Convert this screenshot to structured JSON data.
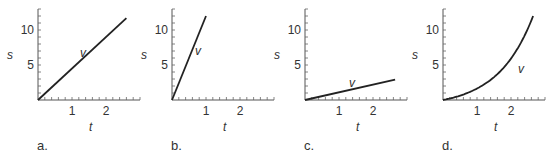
{
  "figure": {
    "panels": [
      {
        "id": "a",
        "label": "a.",
        "curve_label": "v",
        "xlabel": "t",
        "ylabel": "s",
        "x_tick_labels": [
          "1",
          "2"
        ],
        "y_tick_labels": [
          "5",
          "10"
        ]
      },
      {
        "id": "b",
        "label": "b.",
        "curve_label": "v",
        "xlabel": "t",
        "ylabel": "s",
        "x_tick_labels": [
          "1",
          "2"
        ],
        "y_tick_labels": [
          "5",
          "10"
        ]
      },
      {
        "id": "c",
        "label": "c.",
        "curve_label": "v",
        "xlabel": "t",
        "ylabel": "s",
        "x_tick_labels": [
          "1",
          "2"
        ],
        "y_tick_labels": [
          "5",
          "10"
        ]
      },
      {
        "id": "d",
        "label": "d.",
        "curve_label": "v",
        "xlabel": "t",
        "ylabel": "s",
        "x_tick_labels": [
          "1",
          "2"
        ],
        "y_tick_labels": [
          "5",
          "10"
        ]
      }
    ]
  },
  "chart_data": [
    {
      "type": "line",
      "title": "a.",
      "xlabel": "t",
      "ylabel": "s",
      "xlim": [
        0,
        3
      ],
      "ylim": [
        0,
        13
      ],
      "xticks": [
        1,
        2
      ],
      "yticks": [
        5,
        10
      ],
      "grid": false,
      "series": [
        {
          "name": "v",
          "x": [
            0,
            2.6
          ],
          "y": [
            0,
            11.7
          ]
        }
      ]
    },
    {
      "type": "line",
      "title": "b.",
      "xlabel": "t",
      "ylabel": "s",
      "xlim": [
        0,
        3
      ],
      "ylim": [
        0,
        13
      ],
      "xticks": [
        1,
        2
      ],
      "yticks": [
        5,
        10
      ],
      "grid": false,
      "series": [
        {
          "name": "v",
          "x": [
            0,
            1.0
          ],
          "y": [
            0,
            12
          ]
        }
      ]
    },
    {
      "type": "line",
      "title": "c.",
      "xlabel": "t",
      "ylabel": "s",
      "xlim": [
        0,
        3
      ],
      "ylim": [
        0,
        13
      ],
      "xticks": [
        1,
        2
      ],
      "yticks": [
        5,
        10
      ],
      "grid": false,
      "series": [
        {
          "name": "v",
          "x": [
            0,
            2.65
          ],
          "y": [
            0,
            2.9
          ]
        }
      ]
    },
    {
      "type": "line",
      "title": "d.",
      "xlabel": "t",
      "ylabel": "s",
      "xlim": [
        0,
        3
      ],
      "ylim": [
        0,
        13
      ],
      "xticks": [
        1,
        2
      ],
      "yticks": [
        5,
        10
      ],
      "grid": false,
      "series": [
        {
          "name": "v",
          "x": [
            0,
            0.5,
            1.0,
            1.5,
            2.0,
            2.3,
            2.65
          ],
          "y": [
            0,
            0.3,
            1.2,
            2.6,
            4.8,
            7.0,
            12.0
          ]
        }
      ]
    }
  ]
}
